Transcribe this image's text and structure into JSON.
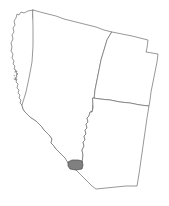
{
  "map": {
    "title": "Southwest United States locator map",
    "background_color": "#ffffff",
    "border_color": "#6b6b6b",
    "border_width": 0.7,
    "highlight_color": "#808080",
    "highlight_border_color": "#4a4a4a",
    "width": 169,
    "height": 206,
    "projection_note": "tilted / rotated orthographic-style outline",
    "states": [
      {
        "id": "california",
        "name": "California",
        "label": "",
        "fill": "#ffffff",
        "stroke": "#6b6b6b",
        "path": "M 11,11 L 10,16 L 12,19 L 11,23 L 8,28 L 9,33 L 7,38 L 8,43 L 7,48 L 9,52 L 8,57 L 10,61 L 9,65 L 12,67 L 11,70 L 13,72 L 12,75 L 10,74 L 11,78 L 13,80 L 12,84 L 14,87 L 13,91 L 15,94 L 14,98 L 17,101 L 16,105 L 19,108 L 21,113 L 24,117 L 27,120 L 31,124 L 34,127 L 36,132 L 39,135 L 42,138 L 41,142 L 44,146 L 47,150 L 51,154 L 54,158 L 58,161 L 62,163 L 68,163 L 68,161 L 82,161 L 82,169 L 68,169 L 68,163 L 62,163 L 60,163 L 56,161 L 53,158 L 50,154 L 47,150 L 44,146 L 41,142 L 42,138 L 39,135 L 36,132 L 34,127 L 31,124 L 27,120 L 24,117 L 21,113 L 19,108 L 16,105 L 17,101 L 14,98 L 15,94 L 13,91 L 14,87 L 12,84 L 13,80 L 11,78 L 10,74 L 12,75 L 13,72 L 11,70 L 12,67 L 9,65 L 10,61 L 8,57 L 9,52 L 7,48 L 8,43 L 7,38 L 9,33 L 8,28 L 11,23 L 12,19 L 10,16 Z"
      },
      {
        "id": "nevada",
        "name": "Nevada",
        "label": "",
        "fill": "#ffffff",
        "stroke": "#6b6b6b"
      },
      {
        "id": "utah",
        "name": "Utah",
        "label": "",
        "fill": "#ffffff",
        "stroke": "#6b6b6b"
      },
      {
        "id": "arizona",
        "name": "Arizona",
        "label": "",
        "fill": "#ffffff",
        "stroke": "#6b6b6b"
      }
    ],
    "highlighted_region": {
      "id": "highlighted-county",
      "name": "highlighted county",
      "label": "",
      "fill": "#808080",
      "stroke": "#4a4a4a",
      "approx_bbox": [
        68,
        160,
        14,
        10
      ]
    },
    "labels": [],
    "legend": [],
    "annotations": []
  }
}
